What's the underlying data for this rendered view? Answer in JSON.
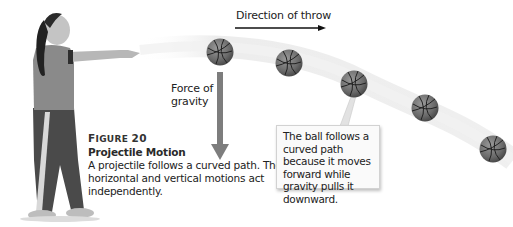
{
  "figure": {
    "number_label": "Figure 20",
    "number_prefix": "F",
    "number_rest": "IGURE",
    "number": "20",
    "title": "Projectile Motion",
    "description": "A projectile follows a curved path. The horizontal and vertical motions act independently."
  },
  "labels": {
    "direction": "Direction of throw",
    "gravity_line1": "Force of",
    "gravity_line2": "gravity"
  },
  "callout": {
    "text": "The ball follows a curved path because it moves forward while gravity pulls it downward."
  },
  "illustration": {
    "subject": "girl throwing basketball",
    "balls": [
      {
        "cx": 220,
        "cy": 52
      },
      {
        "cx": 289,
        "cy": 63
      },
      {
        "cx": 354,
        "cy": 84
      },
      {
        "cx": 425,
        "cy": 108
      },
      {
        "cx": 493,
        "cy": 149
      }
    ],
    "colors": {
      "ball": "#6e6e6e",
      "arrow_gravity": "#7d7d7d",
      "arrow_direction": "#111111",
      "motion_blur": "#e6e6e6"
    }
  }
}
